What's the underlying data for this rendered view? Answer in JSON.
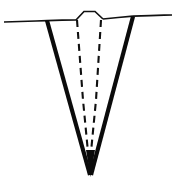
{
  "figure": {
    "background_color": "#ffffff",
    "ink_color": "#0b0b0b",
    "width": 176,
    "height": 182
  },
  "geometry": {
    "surface_line_left": {
      "label": "ground surface left of trench",
      "points": "4,22 20,21.5 36,21 47,20.6"
    },
    "surface_line_bump_left": {
      "label": "surface segment rising to mound",
      "points": "47,20.6 62,20.2 76,20"
    },
    "mound": {
      "label": "raised mound between trench walls",
      "points": "76,20 84,11.5 95,11.5 103,19"
    },
    "surface_line_bump_right": {
      "label": "surface segment right of mound",
      "points": "103,19 118,17.5 133,16.2"
    },
    "surface_line_right": {
      "label": "ground surface right of trench",
      "points": "133,16.2 150,15.6 164,15.2 172,15"
    },
    "trench_wall_left": {
      "label": "left trench wall, thick solid",
      "points": "47,20.5 90,175",
      "stroke_width": 4.2
    },
    "trench_wall_right": {
      "label": "right trench wall, thick solid",
      "points": "133,16.5 91,175",
      "stroke_width": 4.2
    },
    "inner_dashed_left": {
      "label": "inner dashed boundary left",
      "points": "77,20 83,100 88,152",
      "stroke_width": 2.1,
      "dash_pattern": "7 5"
    },
    "inner_dashed_right": {
      "label": "inner dashed boundary right",
      "points": "101,20 96,100 91,152",
      "stroke_width": 2.1,
      "dash_pattern": "7 5"
    },
    "apex": {
      "label": "trench apex point",
      "points": "90,175"
    }
  },
  "chart_data": {
    "type": "line",
    "xlabel": "",
    "ylabel": "",
    "xlim": [
      0,
      176
    ],
    "ylim": [
      182,
      0
    ],
    "grid": false,
    "legend": "none",
    "series": [
      {
        "name": "ground surface",
        "style": "thin solid",
        "x": [
          4,
          20,
          36,
          47,
          62,
          76,
          84,
          95,
          103,
          118,
          133,
          150,
          164,
          172
        ],
        "y": [
          22,
          21.5,
          21,
          20.6,
          20.2,
          20,
          11.5,
          11.5,
          19,
          17.5,
          16.2,
          15.6,
          15.2,
          15
        ]
      },
      {
        "name": "left trench wall",
        "style": "thick solid",
        "x": [
          47,
          90
        ],
        "y": [
          20.5,
          175
        ]
      },
      {
        "name": "right trench wall",
        "style": "thick solid",
        "x": [
          133,
          91
        ],
        "y": [
          16.5,
          175
        ]
      },
      {
        "name": "inner left boundary",
        "style": "dashed",
        "x": [
          77,
          83,
          88
        ],
        "y": [
          20,
          100,
          152
        ]
      },
      {
        "name": "inner right boundary",
        "style": "dashed",
        "x": [
          101,
          96,
          91
        ],
        "y": [
          20,
          100,
          152
        ]
      }
    ],
    "annotations": []
  }
}
